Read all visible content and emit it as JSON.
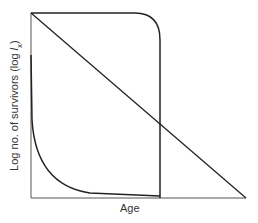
{
  "figure": {
    "type": "survivorship curves",
    "xlabel": "Age",
    "ylabel_prefix": "Log no. of survivors (log ",
    "ylabel_var": "l",
    "ylabel_sub": "x",
    "ylabel_suffix": ")",
    "curves": [
      {
        "name": "Type I (convex)",
        "description": "High survival until old age then sharp drop"
      },
      {
        "name": "Type II (diagonal)",
        "description": "Constant mortality rate"
      },
      {
        "name": "Type III (concave)",
        "description": "High early mortality"
      }
    ],
    "line_color": "#222222"
  }
}
